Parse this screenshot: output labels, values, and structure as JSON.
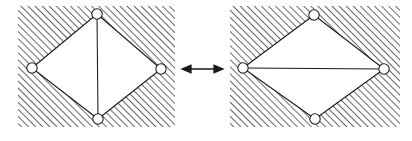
{
  "figure": {
    "background_color": "#ffffff",
    "line_color": "#1a1a1a",
    "hatch_color": "#555555",
    "node_fill": "#ffffff",
    "interior_fill": "#ffffff"
  },
  "panels": [
    {
      "id": "left-panel",
      "name": "left-configuration",
      "label": "",
      "hatched_region": {
        "x": 18,
        "y": 6,
        "width": 157,
        "height": 121
      },
      "diagonal_chord": {
        "type": "vertical",
        "from": "top-node",
        "to": "bottom-node"
      },
      "nodes": [
        {
          "id": "top-node",
          "name": "node-top",
          "cx": 97,
          "cy": 14,
          "r": 5.2,
          "label": ""
        },
        {
          "id": "right-node",
          "name": "node-right",
          "cx": 161,
          "cy": 69,
          "r": 5.2,
          "label": ""
        },
        {
          "id": "bottom-node",
          "name": "node-bottom",
          "cx": 98,
          "cy": 119,
          "r": 5.2,
          "label": ""
        },
        {
          "id": "left-node",
          "name": "node-left",
          "cx": 32,
          "cy": 68,
          "r": 5.2,
          "label": ""
        }
      ],
      "edges": [
        {
          "from": "top-node",
          "to": "right-node"
        },
        {
          "from": "right-node",
          "to": "bottom-node"
        },
        {
          "from": "bottom-node",
          "to": "left-node"
        },
        {
          "from": "left-node",
          "to": "top-node"
        }
      ]
    },
    {
      "id": "right-panel",
      "name": "right-configuration",
      "label": "",
      "hatched_region": {
        "x": 230,
        "y": 6,
        "width": 170,
        "height": 121
      },
      "diagonal_chord": {
        "type": "horizontal",
        "from": "left-node",
        "to": "right-node"
      },
      "nodes": [
        {
          "id": "top-node",
          "name": "node-top",
          "cx": 314,
          "cy": 15,
          "r": 5.2,
          "label": ""
        },
        {
          "id": "right-node",
          "name": "node-right",
          "cx": 384,
          "cy": 69,
          "r": 5.2,
          "label": ""
        },
        {
          "id": "bottom-node",
          "name": "node-bottom",
          "cx": 315,
          "cy": 119,
          "r": 5.2,
          "label": ""
        },
        {
          "id": "left-node",
          "name": "node-left",
          "cx": 243,
          "cy": 68,
          "r": 5.2,
          "label": ""
        }
      ],
      "edges": [
        {
          "from": "top-node",
          "to": "right-node"
        },
        {
          "from": "right-node",
          "to": "bottom-node"
        },
        {
          "from": "bottom-node",
          "to": "left-node"
        },
        {
          "from": "left-node",
          "to": "top-node"
        }
      ]
    }
  ],
  "connector": {
    "name": "double-headed-arrow",
    "type": "double-arrow",
    "label": "",
    "x1": 182,
    "x2": 223,
    "y": 69
  }
}
